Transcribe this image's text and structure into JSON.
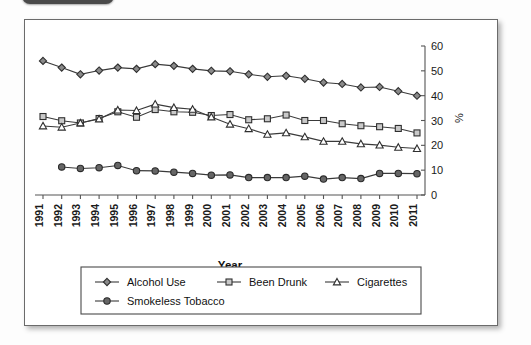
{
  "window": {
    "tab_shape": "dark-rounded-tab"
  },
  "chart_data": {
    "type": "line",
    "title": "",
    "xlabel": "Year",
    "ylabel": "%",
    "ylim": [
      0,
      60
    ],
    "yticks": [
      0,
      10,
      20,
      30,
      40,
      50,
      60
    ],
    "grid": false,
    "legend_position": "bottom",
    "categories": [
      "1991",
      "1992",
      "1993",
      "1994",
      "1995",
      "1996",
      "1997",
      "1998",
      "1999",
      "2000",
      "2001",
      "2002",
      "2003",
      "2004",
      "2005",
      "2006",
      "2007",
      "2008",
      "2009",
      "2010",
      "2011"
    ],
    "series": [
      {
        "name": "Alcohol Use",
        "marker": "filled-diamond",
        "values": [
          54.0,
          51.3,
          48.6,
          50.1,
          51.3,
          50.8,
          52.7,
          52.0,
          50.8,
          50.0,
          49.8,
          48.6,
          47.6,
          48.0,
          46.8,
          45.3,
          44.7,
          43.3,
          43.5,
          41.8,
          40.0
        ]
      },
      {
        "name": "Been Drunk",
        "marker": "open-square",
        "values": [
          31.6,
          29.9,
          29.0,
          30.8,
          33.5,
          31.3,
          34.4,
          33.5,
          33.3,
          32.0,
          32.4,
          30.3,
          30.7,
          32.2,
          30.0,
          30.0,
          28.7,
          27.9,
          27.5,
          26.8,
          25.0
        ]
      },
      {
        "name": "Cigarettes",
        "marker": "open-triangle",
        "values": [
          27.8,
          27.3,
          29.0,
          30.6,
          34.2,
          34.0,
          36.6,
          35.2,
          34.5,
          31.4,
          28.5,
          26.7,
          24.4,
          25.0,
          23.4,
          21.6,
          21.6,
          20.6,
          20.1,
          19.2,
          18.7
        ]
      },
      {
        "name": "Smokeless Tobacco",
        "marker": "filled-circle",
        "values": [
          null,
          11.3,
          10.7,
          11.0,
          11.9,
          9.8,
          9.7,
          9.2,
          8.7,
          8.0,
          8.1,
          7.0,
          7.0,
          7.0,
          7.6,
          6.4,
          7.0,
          6.6,
          8.7,
          8.7,
          8.6
        ]
      }
    ]
  },
  "legend": {
    "items": [
      {
        "label": "Alcohol Use",
        "marker": "filled-diamond"
      },
      {
        "label": "Been Drunk",
        "marker": "open-square"
      },
      {
        "label": "Cigarettes",
        "marker": "open-triangle"
      },
      {
        "label": "Smokeless Tobacco",
        "marker": "filled-circle"
      }
    ]
  }
}
